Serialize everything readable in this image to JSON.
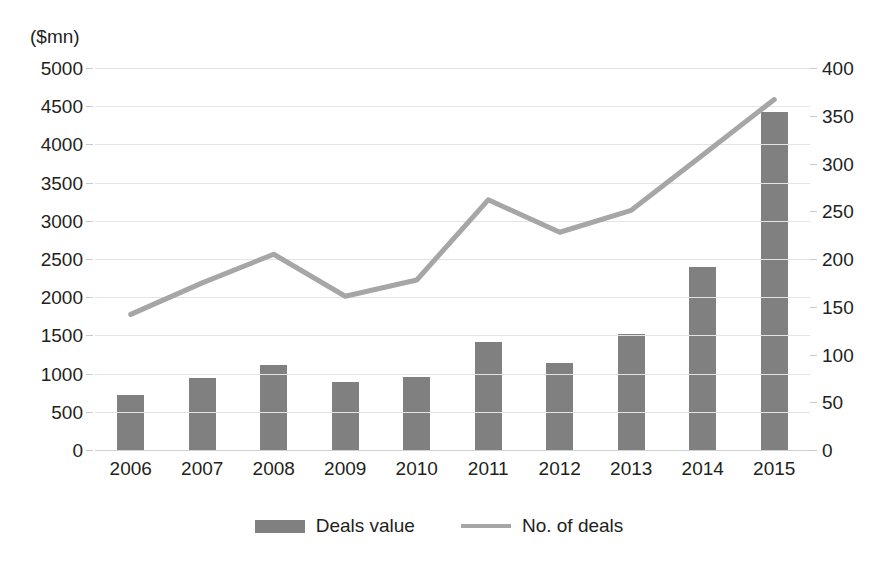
{
  "chart_data": {
    "type": "bar",
    "title": "",
    "subtitle": "",
    "xlabel": "",
    "ylabel": "($mn)",
    "y2label": "",
    "categories": [
      "2006",
      "2007",
      "2008",
      "2009",
      "2010",
      "2011",
      "2012",
      "2013",
      "2014",
      "2015"
    ],
    "series": [
      {
        "name": "Deals value",
        "type": "bar",
        "axis": "left",
        "unit": "$mn",
        "color": "#808080",
        "values": [
          720,
          940,
          1110,
          885,
          960,
          1420,
          1140,
          1520,
          2400,
          4420
        ]
      },
      {
        "name": "No. of deals",
        "type": "line",
        "axis": "right",
        "unit": "deals",
        "color": "#a6a6a6",
        "values": [
          142,
          175,
          205,
          161,
          178,
          262,
          228,
          251,
          309,
          367
        ]
      }
    ],
    "ylim": [
      0,
      5000
    ],
    "y2lim": [
      0,
      400
    ],
    "yticks": [
      0,
      500,
      1000,
      1500,
      2000,
      2500,
      3000,
      3500,
      4000,
      4500,
      5000
    ],
    "y2ticks": [
      0,
      50,
      100,
      150,
      200,
      250,
      300,
      350,
      400
    ],
    "ytick_labels": [
      "0",
      "500",
      "1000",
      "1500",
      "2000",
      "2500",
      "3000",
      "3500",
      "4000",
      "4500",
      "5000"
    ],
    "y2tick_labels": [
      "0",
      "50",
      "100",
      "150",
      "200",
      "250",
      "300",
      "350",
      "400"
    ],
    "grid": true,
    "grid_axis": "y",
    "legend": [
      "Deals value",
      "No. of deals"
    ],
    "legend_position": "bottom-center",
    "background": "#ffffff"
  },
  "axis_unit_label": "($mn)",
  "legend": {
    "bar_label": "Deals value",
    "line_label": "No. of deals"
  }
}
